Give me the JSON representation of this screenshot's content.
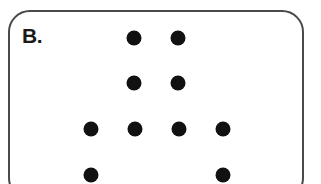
{
  "panel": {
    "label": "B.",
    "border_color": "#4a4a4a",
    "dot_color": "#111111"
  },
  "dots": [
    {
      "row": 1,
      "x": 134,
      "y": 38
    },
    {
      "row": 1,
      "x": 178,
      "y": 38
    },
    {
      "row": 2,
      "x": 134,
      "y": 83
    },
    {
      "row": 2,
      "x": 178,
      "y": 83
    },
    {
      "row": 3,
      "x": 91,
      "y": 129
    },
    {
      "row": 3,
      "x": 135,
      "y": 129
    },
    {
      "row": 3,
      "x": 179,
      "y": 129
    },
    {
      "row": 3,
      "x": 223,
      "y": 129
    },
    {
      "row": 4,
      "x": 91,
      "y": 175
    },
    {
      "row": 4,
      "x": 223,
      "y": 175
    }
  ]
}
